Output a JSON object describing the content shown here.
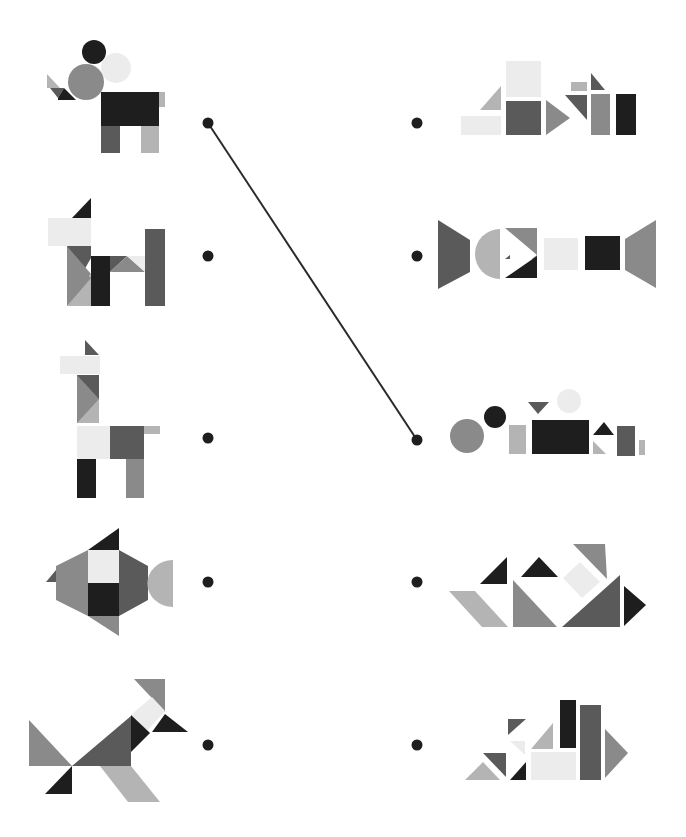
{
  "colors": {
    "black": "#1e1e1e",
    "dark": "#5a5a5a",
    "mid": "#8a8a8a",
    "light": "#b4b4b4",
    "pale": "#ececec",
    "line": "#2a2a2a"
  },
  "left_figures": [
    {
      "id": "elephant",
      "label": "Elephant figure",
      "dot": [
        208,
        123
      ]
    },
    {
      "id": "dog",
      "label": "Dog figure",
      "dot": [
        208,
        256
      ]
    },
    {
      "id": "giraffe",
      "label": "Giraffe / llama figure",
      "dot": [
        208,
        438
      ]
    },
    {
      "id": "fish",
      "label": "Fish figure",
      "dot": [
        208,
        582
      ]
    },
    {
      "id": "fox",
      "label": "Fox / running animal figure",
      "dot": [
        208,
        745
      ]
    }
  ],
  "right_sets": [
    {
      "id": "set-1",
      "label": "Shape set 1",
      "dot": [
        417,
        123
      ]
    },
    {
      "id": "set-2",
      "label": "Shape set 2",
      "dot": [
        417,
        256
      ]
    },
    {
      "id": "set-3",
      "label": "Shape set 3",
      "dot": [
        417,
        440
      ]
    },
    {
      "id": "set-4",
      "label": "Shape set 4",
      "dot": [
        417,
        582
      ]
    },
    {
      "id": "set-5",
      "label": "Shape set 5",
      "dot": [
        417,
        745
      ]
    }
  ],
  "connections": [
    {
      "from": "elephant",
      "to": "set-3",
      "x1": 208,
      "y1": 123,
      "x2": 417,
      "y2": 440
    }
  ]
}
